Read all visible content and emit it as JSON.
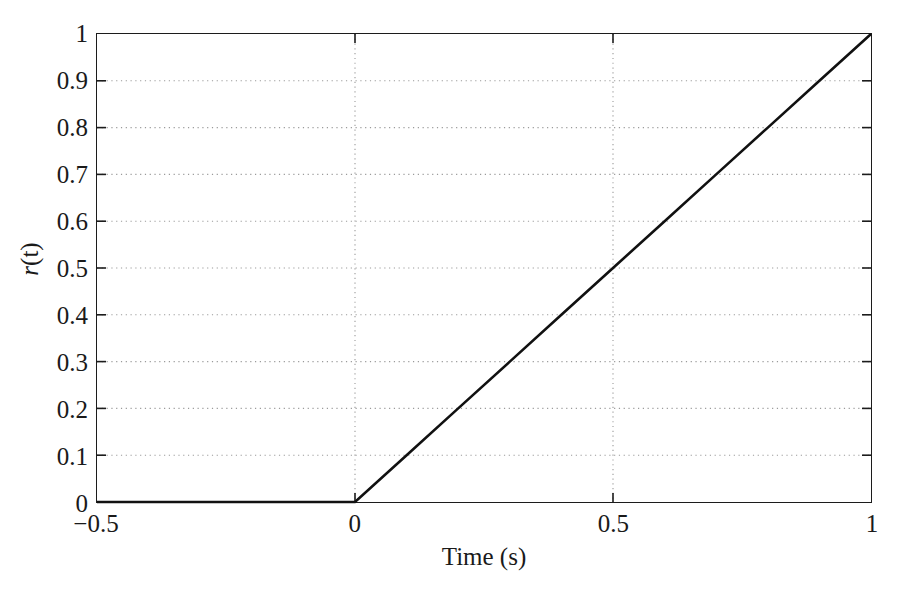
{
  "figure": {
    "background_color": "#ffffff",
    "axis_color": "#1c1c1c",
    "grid_color": "#9a9a9a",
    "line_color": "#111111"
  },
  "axes": {
    "ylabel_text": "r(t)",
    "ylabel_var": "r",
    "ylabel_arg": "(t)",
    "xlabel_text": "Time (s)"
  },
  "chart_data": {
    "type": "line",
    "title": "",
    "subtitle": "",
    "xlabel": "Time (s)",
    "ylabel": "r(t)",
    "xlim": [
      -0.5,
      1
    ],
    "ylim": [
      0,
      1
    ],
    "grid": true,
    "legend": null,
    "legend_position": "none",
    "xticks": [
      -0.5,
      0,
      0.5,
      1
    ],
    "xticklabels": [
      "−0.5",
      "0",
      "0.5",
      "1"
    ],
    "yticks": [
      0,
      0.1,
      0.2,
      0.3,
      0.4,
      0.5,
      0.6,
      0.7,
      0.8,
      0.9,
      1
    ],
    "yticklabels": [
      "0",
      "0.1",
      "0.2",
      "0.3",
      "0.4",
      "0.5",
      "0.6",
      "0.7",
      "0.8",
      "0.9",
      "1"
    ],
    "x_gridlines": [
      0,
      0.5
    ],
    "y_gridlines": [
      0.1,
      0.2,
      0.3,
      0.4,
      0.5,
      0.6,
      0.7,
      0.8,
      0.9
    ],
    "series": [
      {
        "name": "r(t)",
        "description": "unit ramp function r(t) = t u(t)",
        "color": "#111111",
        "linewidth": 2.6,
        "linestyle": "solid",
        "x": [
          -0.5,
          -0.4,
          -0.3,
          -0.2,
          -0.1,
          0,
          0.1,
          0.2,
          0.3,
          0.4,
          0.5,
          0.6,
          0.7,
          0.8,
          0.9,
          1
        ],
        "y": [
          0,
          0,
          0,
          0,
          0,
          0,
          0.1,
          0.2,
          0.3,
          0.4,
          0.5,
          0.6,
          0.7,
          0.8,
          0.9,
          1
        ]
      }
    ],
    "annotations": []
  }
}
